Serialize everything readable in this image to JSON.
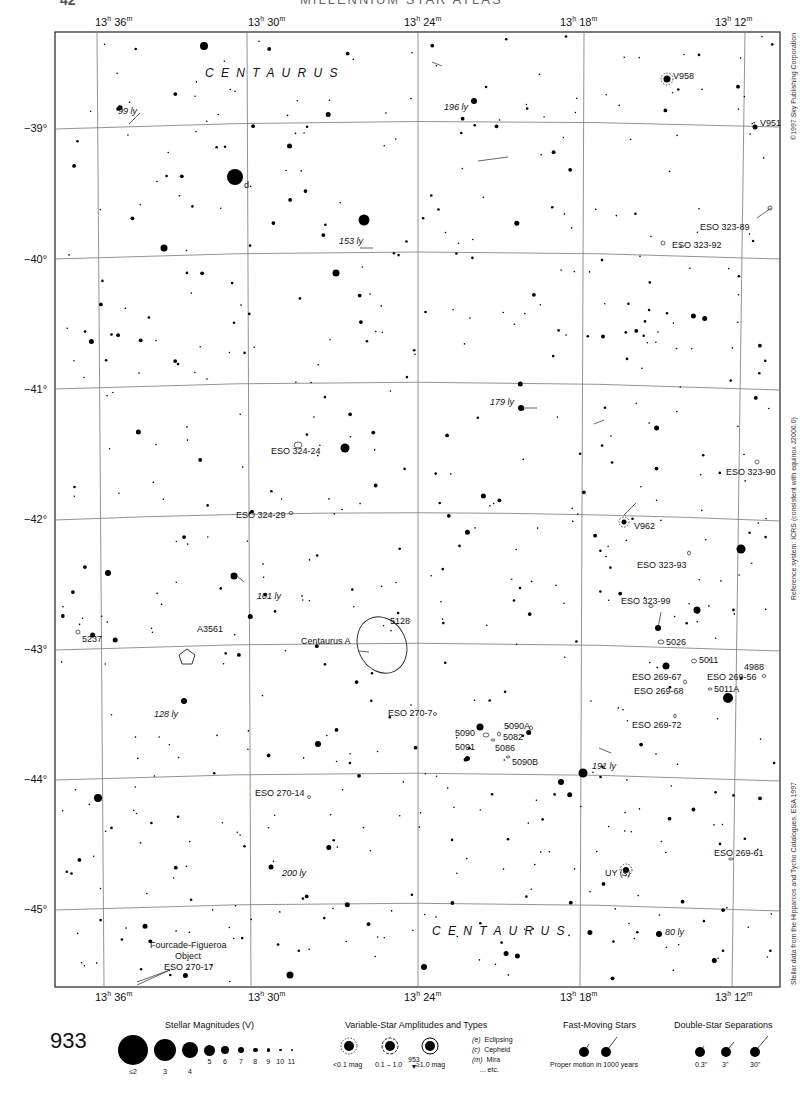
{
  "header": {
    "page_number": "42",
    "title": "MILLENNIUM STAR ATLAS"
  },
  "ra_labels": [
    {
      "h": "13",
      "m": "36",
      "x": 95
    },
    {
      "h": "13",
      "m": "30",
      "x": 248
    },
    {
      "h": "13",
      "m": "24",
      "x": 404
    },
    {
      "h": "13",
      "m": "18",
      "x": 560
    },
    {
      "h": "13",
      "m": "12",
      "x": 715
    }
  ],
  "ra_suffix": {
    "h": "h",
    "m": "m"
  },
  "dec_labels": [
    {
      "text": "−39°",
      "y": 129
    },
    {
      "text": "−40°",
      "y": 260
    },
    {
      "text": "−41°",
      "y": 390
    },
    {
      "text": "−42°",
      "y": 520
    },
    {
      "text": "−43°",
      "y": 650
    },
    {
      "text": "−44°",
      "y": 780
    },
    {
      "text": "−45°",
      "y": 910
    }
  ],
  "constellation_labels": [
    {
      "text": "C E N T A U R U S",
      "x": 205,
      "y": 74
    },
    {
      "text": "C E N T A U R U S",
      "x": 432,
      "y": 932
    }
  ],
  "object_labels": [
    {
      "text": "V958",
      "x": 673,
      "y": 77
    },
    {
      "text": "V951",
      "x": 760,
      "y": 124
    },
    {
      "text": "d",
      "x": 244,
      "y": 186
    },
    {
      "text": "ESO 323-89",
      "x": 700,
      "y": 228
    },
    {
      "text": "ESO 323-92",
      "x": 672,
      "y": 246
    },
    {
      "text": "ESO 324-24",
      "x": 271,
      "y": 452
    },
    {
      "text": "ESO 323-90",
      "x": 726,
      "y": 473
    },
    {
      "text": "ESO 324-29",
      "x": 236,
      "y": 516
    },
    {
      "text": "V962",
      "x": 634,
      "y": 527
    },
    {
      "text": "ESO 323-93",
      "x": 637,
      "y": 566
    },
    {
      "text": "A3561",
      "x": 197,
      "y": 630
    },
    {
      "text": "5237",
      "x": 82,
      "y": 640
    },
    {
      "text": "5128",
      "x": 390,
      "y": 622
    },
    {
      "text": "Centaurus A",
      "x": 301,
      "y": 642
    },
    {
      "text": "ESO 323-99",
      "x": 621,
      "y": 602
    },
    {
      "text": "5026",
      "x": 666,
      "y": 643
    },
    {
      "text": "5011",
      "x": 699,
      "y": 661
    },
    {
      "text": "4988",
      "x": 744,
      "y": 668
    },
    {
      "text": "ESO 269-67",
      "x": 632,
      "y": 678
    },
    {
      "text": "ESO 269-56",
      "x": 707,
      "y": 678
    },
    {
      "text": "ESO 269-68",
      "x": 634,
      "y": 692
    },
    {
      "text": "5011A",
      "x": 714,
      "y": 690
    },
    {
      "text": "ESO 270-7",
      "x": 388,
      "y": 714
    },
    {
      "text": "5090A",
      "x": 504,
      "y": 727
    },
    {
      "text": "5090",
      "x": 455,
      "y": 734
    },
    {
      "text": "5082",
      "x": 503,
      "y": 738
    },
    {
      "text": "ESO 269-72",
      "x": 632,
      "y": 726
    },
    {
      "text": "5091",
      "x": 455,
      "y": 748
    },
    {
      "text": "5086",
      "x": 495,
      "y": 749
    },
    {
      "text": "5090B",
      "x": 512,
      "y": 763
    },
    {
      "text": "ESO 270-14",
      "x": 255,
      "y": 794
    },
    {
      "text": "ESO 269-61",
      "x": 714,
      "y": 854
    },
    {
      "text": "UY (s)",
      "x": 605,
      "y": 874
    },
    {
      "text": "Fourcade-Figueroa",
      "x": 150,
      "y": 946
    },
    {
      "text": "Object",
      "x": 175,
      "y": 957
    },
    {
      "text": "ESO 270-17",
      "x": 164,
      "y": 968
    }
  ],
  "distance_labels": [
    {
      "text": "99 ly",
      "x": 118,
      "y": 112
    },
    {
      "text": "196 ly",
      "x": 444,
      "y": 108
    },
    {
      "text": "153 ly",
      "x": 339,
      "y": 242
    },
    {
      "text": "179 ly",
      "x": 490,
      "y": 403
    },
    {
      "text": "101 ly",
      "x": 257,
      "y": 597
    },
    {
      "text": "128 ly",
      "x": 154,
      "y": 715
    },
    {
      "text": "191 ly",
      "x": 592,
      "y": 767
    },
    {
      "text": "200 ly",
      "x": 282,
      "y": 874
    },
    {
      "text": "80 ly",
      "x": 665,
      "y": 933
    }
  ],
  "side_credits": {
    "top": "©1997 Sky Publishing Corporation",
    "middle": "Reference system: ICRS (consistent with equinox J2000.0)",
    "bottom": "Stellar data from the Hipparcos and Tycho Catalogues, ESA 1997"
  },
  "legend": {
    "page_number": "933",
    "magnitudes": {
      "title": "Stellar Magnitudes (V)",
      "items": [
        {
          "label": "≤2",
          "size": 30
        },
        {
          "label": "3",
          "size": 22
        },
        {
          "label": "4",
          "size": 16
        },
        {
          "label": "5",
          "size": 11
        },
        {
          "label": "6",
          "size": 8
        },
        {
          "label": "7",
          "size": 6
        },
        {
          "label": "8",
          "size": 4.5
        },
        {
          "label": "9",
          "size": 3.5
        },
        {
          "label": "10",
          "size": 2.5
        },
        {
          "label": "11",
          "size": 2
        }
      ]
    },
    "variables": {
      "title": "Variable-Star Amplitudes and Types",
      "amplitudes": [
        "<0.1 mag",
        "0.1 – 1.0",
        "≥1.0 mag"
      ],
      "types": [
        {
          "code": "(e)",
          "name": "Eclipsing"
        },
        {
          "code": "(c)",
          "name": "Cepheid"
        },
        {
          "code": "(m)",
          "name": "Mira"
        },
        {
          "code": "",
          "name": "... etc."
        }
      ],
      "next_page": "953"
    },
    "fast_moving": {
      "title": "Fast-Moving Stars",
      "caption": "Proper motion in 1000 years"
    },
    "double_star": {
      "title": "Double-Star Separations",
      "items": [
        "0.3\"",
        "3\"",
        "30\""
      ]
    }
  }
}
